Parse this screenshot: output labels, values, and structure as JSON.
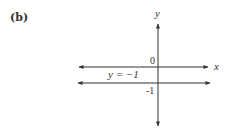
{
  "figure": {
    "panel_label": "(b)",
    "axes": {
      "x_label": "x",
      "y_label": "y",
      "origin_label": "0",
      "y_tick_label": "-1"
    },
    "line": {
      "equation_label": "y = −1",
      "y_value": -1
    },
    "colors": {
      "ink": "#333333",
      "background": "#ffffff"
    }
  }
}
